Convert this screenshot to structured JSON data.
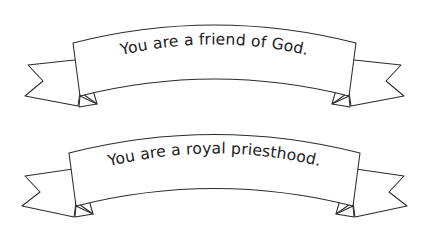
{
  "canvas": {
    "width": 429,
    "height": 247,
    "background_color": "#ffffff",
    "stroke_color": "#2b2b2b",
    "text_color": "#222222"
  },
  "banners": [
    {
      "id": "banner-top",
      "text": "You are a friend of God.",
      "shape": "arched-ribbon-with-swallowtail-ends"
    },
    {
      "id": "banner-bottom",
      "text": "You are a royal priesthood.",
      "shape": "arched-ribbon-with-swallowtail-ends"
    }
  ]
}
